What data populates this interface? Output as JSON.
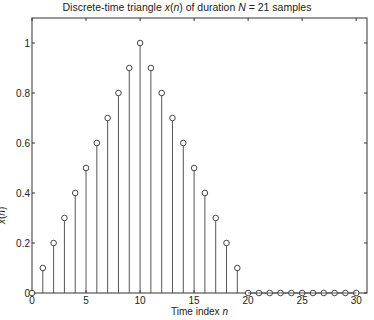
{
  "chart_data": {
    "type": "stem",
    "title_parts": [
      "Discrete-time triangle ",
      "x",
      "(",
      "n",
      ") of duration ",
      "N",
      " = 21 samples"
    ],
    "title": "Discrete-time triangle x(n) of duration N = 21 samples",
    "xlabel": "Time index n",
    "xlabel_parts": [
      "Time index ",
      "n"
    ],
    "ylabel": "x(n)",
    "xlim": [
      0,
      31
    ],
    "ylim": [
      0,
      1.1
    ],
    "xticks": [
      0,
      5,
      10,
      15,
      20,
      25,
      30
    ],
    "yticks": [
      0,
      0.2,
      0.4,
      0.6,
      0.8,
      1
    ],
    "ytick_labels": [
      "0",
      "0.2",
      "0.4",
      "0.6",
      "0.8",
      "1"
    ],
    "grid": false,
    "x": [
      0,
      1,
      2,
      3,
      4,
      5,
      6,
      7,
      8,
      9,
      10,
      11,
      12,
      13,
      14,
      15,
      16,
      17,
      18,
      19,
      20,
      21,
      22,
      23,
      24,
      25,
      26,
      27,
      28,
      29,
      30
    ],
    "values": [
      0,
      0.1,
      0.2,
      0.3,
      0.4,
      0.5,
      0.6,
      0.7,
      0.8,
      0.9,
      1.0,
      0.9,
      0.8,
      0.7,
      0.6,
      0.5,
      0.4,
      0.3,
      0.2,
      0.1,
      0,
      0,
      0,
      0,
      0,
      0,
      0,
      0,
      0,
      0,
      0
    ]
  },
  "layout": {
    "axes": {
      "left": 32,
      "top": 18,
      "right": 367,
      "bottom": 293
    },
    "colors": {
      "stem": "#555555",
      "axis": "#333333",
      "marker_fill": "#ffffff"
    }
  }
}
